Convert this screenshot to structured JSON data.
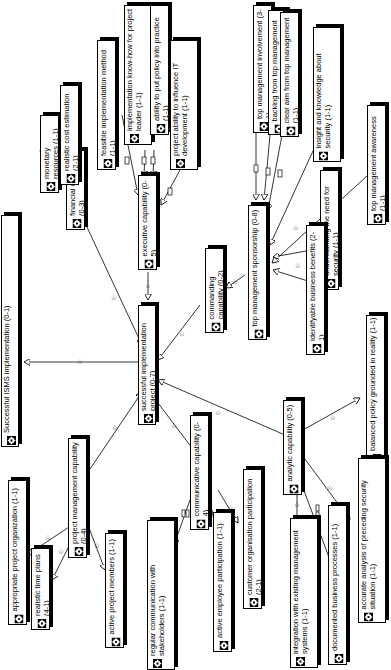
{
  "diagram": {
    "type": "goal-dependency-tree",
    "nodes": [
      {
        "id": "root",
        "label": "Successful ISMS implementation (0-1)",
        "x": 1,
        "y": 215,
        "w": 17,
        "h": 232
      },
      {
        "id": "sip",
        "label": "successful implementation project (0-7)",
        "x": 39,
        "y": 307,
        "w": 17,
        "h": 0
      },
      {
        "id": "fin",
        "label": "financial capability (0-3)",
        "x": 0,
        "y": 0,
        "w": 0,
        "h": 0
      },
      {
        "id": "mon",
        "label": "monetary resources (1-1)"
      },
      {
        "id": "rce",
        "label": "realistic cost estimation (2-1)"
      },
      {
        "id": "exe",
        "label": "executive capability (0-5)"
      },
      {
        "id": "fim",
        "label": "feasible implementation method (1-1)"
      },
      {
        "id": "ikh",
        "label": "implementation know-how for project leader (1-1)"
      },
      {
        "id": "apl",
        "label": "ability to put policy into practice (1-1)"
      },
      {
        "id": "pai",
        "label": "project ability to influence IT development (1-1)"
      },
      {
        "id": "com",
        "label": "commanding capability (0-2)"
      },
      {
        "id": "tms",
        "label": "top management sponsorship (0-8)"
      },
      {
        "id": "tmi",
        "label": "top management involvement (3-1)"
      },
      {
        "id": "bft",
        "label": "backing from top management (6-1)"
      },
      {
        "id": "cat",
        "label": "clear aim from top management (1-1)"
      },
      {
        "id": "iks",
        "label": "insight and knowledge about security (1-1)"
      },
      {
        "id": "tma",
        "label": "top management awareness (1-1)"
      },
      {
        "id": "und",
        "label": "understanding the need for security (1-1)"
      },
      {
        "id": "ibb",
        "label": "identifyable business benefits (2-1)"
      },
      {
        "id": "bpg",
        "label": "balanced policy grounded in reality (1-1)"
      },
      {
        "id": "ana",
        "label": "analytic capability (0-5)"
      },
      {
        "id": "aap",
        "label": "accurate analysis of preceding security situation (1-1)"
      },
      {
        "id": "dbp",
        "label": "documented business processes (1-1)"
      },
      {
        "id": "iem",
        "label": "integration with existing management systems (1-1)"
      },
      {
        "id": "cmc",
        "label": "communicative capability (0-4)"
      },
      {
        "id": "cop",
        "label": "customer organisation participation (2-1)"
      },
      {
        "id": "aep",
        "label": "active employee participation (1-1)"
      },
      {
        "id": "rcs",
        "label": "regular communication with stakeholders (1-1)"
      },
      {
        "id": "pmc",
        "label": "project management capability (0-4)"
      },
      {
        "id": "apo",
        "label": "appropriate project organization (1-1)"
      },
      {
        "id": "rtp",
        "label": "realistic time plans (4-1)"
      },
      {
        "id": "apm",
        "label": "active project members (1-1)"
      }
    ],
    "edge_marks": {
      "star": "☆",
      "rect": "▭",
      "double_rect": "▭▭"
    }
  }
}
